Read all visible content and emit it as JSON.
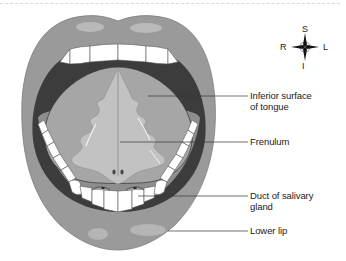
{
  "figure": {
    "type": "anatomical-diagram"
  },
  "labels": [
    {
      "id": "inferior-surface",
      "text": "Inferior surface\nof tongue"
    },
    {
      "id": "frenulum",
      "text": "Frenulum"
    },
    {
      "id": "duct",
      "text": "Duct of salivary\ngland"
    },
    {
      "id": "lower-lip",
      "text": "Lower lip"
    }
  ],
  "compass": {
    "superior": "S",
    "inferior": "I",
    "right": "R",
    "left": "L"
  },
  "colors": {
    "lip": "#9a9a9a",
    "lip_highlight": "#c4c4c4",
    "cavity": "#3c3c3c",
    "tongue": "#a6a6a6",
    "frenulum_area": "#c2c2c2",
    "teeth": "#ffffff",
    "floor": "#8e8e8e"
  }
}
